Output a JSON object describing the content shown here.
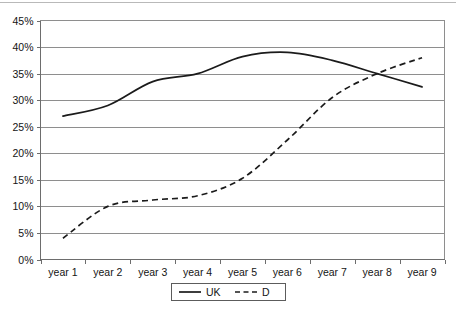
{
  "chart_data": {
    "type": "line",
    "title": "",
    "subtitle": "",
    "xlabel": "",
    "ylabel": "",
    "categories": [
      "year 1",
      "year 2",
      "year 3",
      "year 4",
      "year 5",
      "year 6",
      "year 7",
      "year 8",
      "year 9"
    ],
    "series": [
      {
        "name": "UK",
        "style": "solid",
        "values": [
          27,
          29,
          33.5,
          35,
          38.2,
          39,
          37.5,
          35,
          32.5
        ]
      },
      {
        "name": "D",
        "style": "dashed",
        "values": [
          4,
          10,
          11.2,
          12,
          15.3,
          22.5,
          30.5,
          35,
          38
        ]
      }
    ],
    "ylim": [
      0,
      45
    ],
    "ytick_values": [
      0,
      5,
      10,
      15,
      20,
      25,
      30,
      35,
      40,
      45
    ],
    "ytick_labels": [
      "0%",
      "5%",
      "10%",
      "15%",
      "20%",
      "25%",
      "30%",
      "35%",
      "40%",
      "45%"
    ],
    "grid": true,
    "grid_axis": "y",
    "legend": {
      "position": "bottom-center",
      "entries": [
        {
          "label": "UK",
          "style": "solid"
        },
        {
          "label": "D",
          "style": "dashed"
        }
      ]
    },
    "colors": {
      "series_line": "#1b1b1b",
      "gridline": "#8e8e8e",
      "axis": "#6d6d6d",
      "text": "#141414",
      "background": "#ffffff"
    }
  }
}
